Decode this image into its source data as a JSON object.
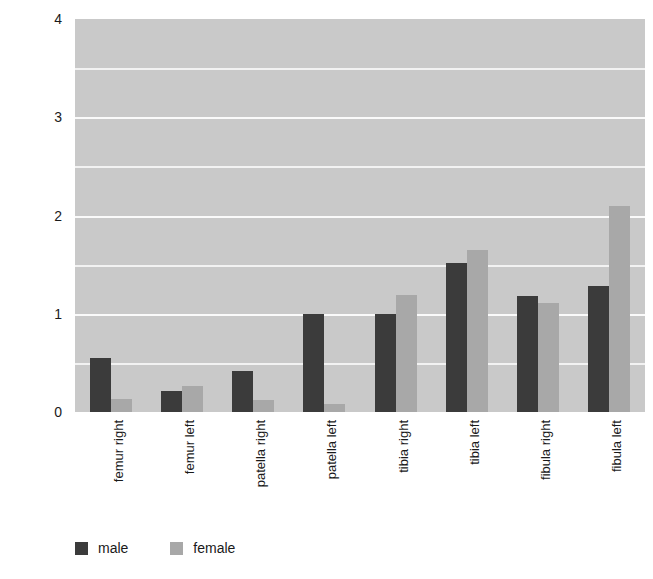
{
  "chart_data": {
    "type": "bar",
    "title": "",
    "xlabel": "",
    "ylabel": "% prevalence",
    "ylim": [
      0,
      4
    ],
    "yticks": [
      0,
      1,
      2,
      3,
      4
    ],
    "ytick_labels": [
      "0",
      "1",
      "2",
      "3",
      "4"
    ],
    "gridlines": [
      0.5,
      1,
      1.5,
      2,
      2.5,
      3,
      3.5
    ],
    "grid": true,
    "legend_position": "bottom-left",
    "categories": [
      "femur right",
      "femur left",
      "patella right",
      "patella left",
      "tibia right",
      "tibia left",
      "fibula right",
      "fibula left"
    ],
    "series": [
      {
        "name": "male",
        "color": "#3b3b3b",
        "values": [
          0.55,
          0.21,
          0.42,
          1.0,
          1.0,
          1.52,
          1.18,
          1.28
        ]
      },
      {
        "name": "female",
        "color": "#a8a8a8",
        "values": [
          0.13,
          0.26,
          0.12,
          0.08,
          1.19,
          1.65,
          1.11,
          2.1
        ]
      }
    ]
  },
  "legend": {
    "entries": [
      {
        "label": "male"
      },
      {
        "label": "female"
      }
    ]
  },
  "colors": {
    "plot_background": "#c9c9c9",
    "gridline": "#f7f7f7",
    "male": "#3b3b3b",
    "female": "#a8a8a8",
    "text": "#1a1a1a"
  }
}
